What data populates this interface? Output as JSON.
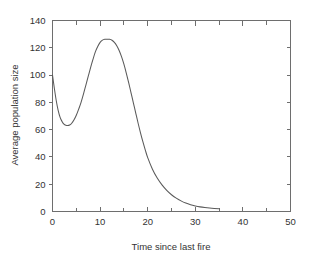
{
  "chart_data": {
    "type": "line",
    "title": "",
    "subtitle": "",
    "xlabel": "Time since last fire",
    "ylabel": "Average population size",
    "xlim": [
      0,
      50
    ],
    "ylim": [
      0,
      140
    ],
    "xticks": [
      0,
      10,
      20,
      30,
      40,
      50
    ],
    "xtick_labels": [
      "0",
      "10",
      "20",
      "30",
      "40",
      "50"
    ],
    "xminor_step": 5,
    "yticks": [
      0,
      20,
      40,
      60,
      80,
      100,
      120,
      140
    ],
    "ytick_labels": [
      "0",
      "20",
      "40",
      "60",
      "80",
      "100",
      "120",
      "140"
    ],
    "grid": false,
    "legend": "none",
    "line_color": "#5a5a5a",
    "axis_color": "#6e6e6e",
    "background": "#ffffff",
    "annotations": {
      "start_value": 100,
      "trough_x": 3,
      "trough_y": 63,
      "peak_x": 12,
      "peak_y": 126,
      "curve_end_x": 35,
      "curve_end_y": 2
    },
    "series": [
      {
        "name": "Average population size",
        "x": [
          0,
          0.4,
          0.8,
          1.2,
          1.6,
          2.0,
          2.4,
          2.8,
          3.2,
          3.6,
          4.0,
          4.5,
          5.0,
          5.5,
          6.0,
          6.5,
          7.0,
          7.5,
          8.0,
          8.5,
          9.0,
          9.5,
          10.0,
          10.5,
          11.0,
          11.5,
          12.0,
          12.5,
          13.0,
          13.5,
          14.0,
          14.5,
          15.0,
          15.5,
          16.0,
          16.5,
          17.0,
          17.5,
          18.0,
          18.5,
          19.0,
          19.5,
          20.0,
          21.0,
          22.0,
          23.0,
          24.0,
          25.0,
          26.0,
          27.0,
          28.0,
          29.0,
          30.0,
          31.0,
          32.0,
          33.0,
          34.0,
          35.0
        ],
        "y": [
          100,
          90,
          81,
          74,
          69,
          66,
          64,
          63.2,
          63.0,
          63.4,
          64.5,
          67,
          70.5,
          75,
          80,
          86,
          92.5,
          99,
          105.5,
          111.5,
          117,
          121,
          124,
          125.6,
          126.2,
          126.3,
          126.2,
          125.5,
          124,
          121.5,
          118,
          113.5,
          108,
          101.5,
          94.5,
          87,
          79.5,
          72,
          64.5,
          57.5,
          51,
          45,
          39.5,
          31,
          24.5,
          19.5,
          15.5,
          12.3,
          9.8,
          7.8,
          6.2,
          5.0,
          4.1,
          3.4,
          2.9,
          2.5,
          2.2,
          2.0
        ]
      }
    ]
  }
}
